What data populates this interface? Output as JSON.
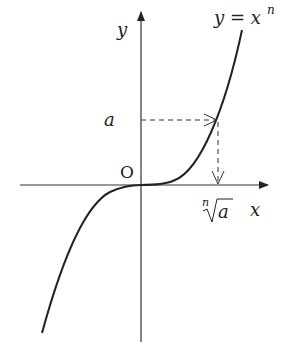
{
  "diagram": {
    "labels": {
      "y_axis": "y",
      "x_axis": "x",
      "origin": "O",
      "equation_lhs": "y = x",
      "equation_exp": "n",
      "a": "a",
      "root_index": "n",
      "root_radicand": "a"
    },
    "colors": {
      "stroke": "#222222",
      "background": "#ffffff"
    }
  }
}
